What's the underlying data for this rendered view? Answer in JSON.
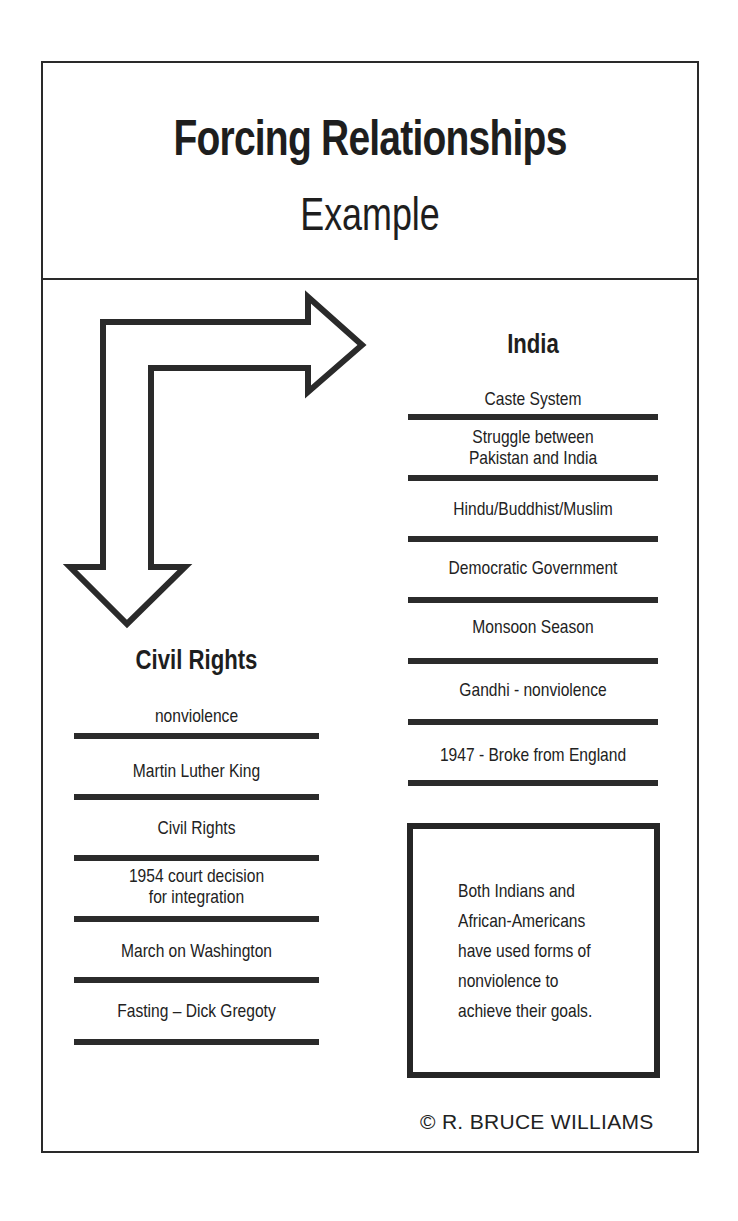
{
  "title": "Forcing Relationships",
  "subtitle": "Example",
  "india": {
    "heading": "India",
    "items": [
      "Caste System",
      "Struggle between",
      "Pakistan and India",
      "Hindu/Buddhist/Muslim",
      "Democratic Government",
      "Monsoon Season",
      "Gandhi - nonviolence",
      "1947 - Broke from England"
    ]
  },
  "civil_rights": {
    "heading": "Civil Rights",
    "items": [
      "nonviolence",
      "Martin Luther King",
      "Civil Rights",
      "1954 court decision",
      "for integration",
      "March on Washington",
      "Fasting – Dick Gregoty"
    ]
  },
  "conclusion": {
    "lines": [
      "Both Indians and",
      "African-Americans",
      "have used forms of",
      "nonviolence to",
      "achieve their goals."
    ]
  },
  "credit": "© R. BRUCE WILLIAMS",
  "icons": {
    "arrow": "bent-arrow-icon"
  },
  "colors": {
    "ink": "#2a2a2a",
    "background": "#ffffff"
  }
}
